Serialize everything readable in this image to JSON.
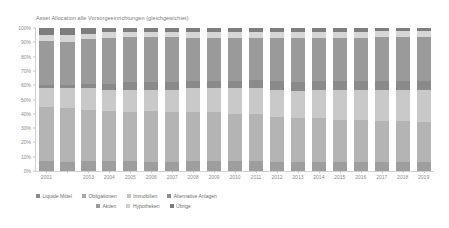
{
  "chart_data": {
    "type": "bar",
    "subtype": "stacked-100-percent",
    "title": "Asset Allocation alle Vorsorgeeinrichtungen (gleichgewichtet)",
    "xlabel": "",
    "ylabel": "",
    "ylim": [
      0,
      100
    ],
    "grid": false,
    "legend_position": "bottom-left",
    "yticks": [
      "0%",
      "10%",
      "20%",
      "30%",
      "40%",
      "50%",
      "60%",
      "70%",
      "80%",
      "90%",
      "100%"
    ],
    "ytick_values": [
      0,
      10,
      20,
      30,
      40,
      50,
      60,
      70,
      80,
      90,
      100
    ],
    "categories": [
      "2001",
      "2002",
      "2003",
      "2004",
      "2005",
      "2006",
      "2007",
      "2008",
      "2009",
      "2010",
      "2011",
      "2012",
      "2013",
      "2014",
      "2015",
      "2016",
      "2017",
      "2018",
      "2019"
    ],
    "xtick_labels": [
      "2001",
      "",
      "2003",
      "2004",
      "2005",
      "2006",
      "2007",
      "2008",
      "2009",
      "2010",
      "2011",
      "2012",
      "2013",
      "2014",
      "2015",
      "2016",
      "2017",
      "2018",
      "2019"
    ],
    "series": [
      {
        "name": "Liquide Mittel",
        "color": "#9e9e9e",
        "values": [
          7,
          6,
          7,
          7,
          7,
          6,
          6,
          7,
          7,
          7,
          7,
          6,
          6,
          6,
          6,
          6,
          6,
          6,
          6
        ]
      },
      {
        "name": "Obligationen",
        "color": "#b4b4b4",
        "values": [
          38,
          38,
          36,
          35,
          34,
          36,
          35,
          34,
          34,
          33,
          33,
          32,
          31,
          31,
          30,
          30,
          29,
          29,
          28
        ]
      },
      {
        "name": "Immobilien",
        "color": "#c9c9c9",
        "values": [
          13,
          14,
          15,
          15,
          16,
          15,
          16,
          17,
          17,
          18,
          18,
          19,
          19,
          20,
          21,
          21,
          22,
          22,
          23
        ]
      },
      {
        "name": "Alternative Anlagen",
        "color": "#8a8a8a",
        "values": [
          2,
          2,
          3,
          4,
          5,
          5,
          5,
          5,
          5,
          5,
          6,
          6,
          6,
          6,
          6,
          6,
          6,
          6,
          6
        ]
      },
      {
        "name": "Aktien",
        "color": "#9a9a9a",
        "values": [
          31,
          30,
          31,
          32,
          32,
          32,
          32,
          30,
          30,
          30,
          29,
          30,
          31,
          30,
          30,
          30,
          31,
          31,
          31
        ]
      },
      {
        "name": "Hypotheken",
        "color": "#d6d6d6",
        "values": [
          4,
          5,
          4,
          4,
          3,
          3,
          3,
          4,
          4,
          4,
          4,
          4,
          4,
          4,
          4,
          4,
          4,
          4,
          4
        ]
      },
      {
        "name": "Übrige",
        "color": "#7e7e7e",
        "values": [
          5,
          5,
          4,
          3,
          3,
          3,
          3,
          3,
          3,
          3,
          3,
          3,
          3,
          3,
          3,
          3,
          2,
          2,
          2
        ]
      }
    ]
  },
  "legend": {
    "rows": [
      [
        {
          "label": "Liquide Mittel",
          "color": "#8c8c8c"
        },
        {
          "label": "Obligationen",
          "color": "#a8a8a8"
        },
        {
          "label": "Immobilien",
          "color": "#c4c4c4"
        },
        {
          "label": "Alternative Anlagen",
          "color": "#8a8a8a"
        }
      ],
      [
        {
          "label": "Aktien",
          "color": "#9a9a9a"
        },
        {
          "label": "Hypotheken",
          "color": "#d0d0d0"
        },
        {
          "label": "Übrige",
          "color": "#7e7e7e"
        }
      ]
    ]
  }
}
